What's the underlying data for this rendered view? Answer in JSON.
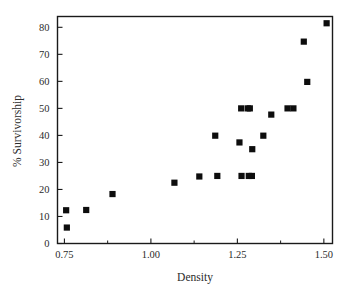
{
  "chart_data": {
    "type": "scatter",
    "title": "",
    "xlabel": "Density",
    "ylabel": "% Survivorship",
    "xlim": [
      0.73,
      1.525
    ],
    "ylim": [
      0,
      84
    ],
    "grid": false,
    "legend": "none",
    "x_ticks": [
      "0.75",
      "1.00",
      "1.25",
      "1.50"
    ],
    "x_tick_values": [
      0.75,
      1.0,
      1.25,
      1.5
    ],
    "x_minor_tick_values": [
      0.875,
      1.125,
      1.375
    ],
    "y_ticks": [
      "0",
      "10",
      "20",
      "30",
      "40",
      "50",
      "60",
      "70",
      "80"
    ],
    "y_tick_values": [
      0,
      10,
      20,
      30,
      40,
      50,
      60,
      70,
      80
    ],
    "marker": "filled-square",
    "marker_color": "#0d0d0d",
    "points": [
      {
        "x": 0.755,
        "y": 12.3
      },
      {
        "x": 0.757,
        "y": 5.9
      },
      {
        "x": 0.813,
        "y": 12.4
      },
      {
        "x": 0.889,
        "y": 18.3
      },
      {
        "x": 1.068,
        "y": 22.5
      },
      {
        "x": 1.14,
        "y": 24.8
      },
      {
        "x": 1.186,
        "y": 39.9
      },
      {
        "x": 1.192,
        "y": 25.0
      },
      {
        "x": 1.256,
        "y": 37.4
      },
      {
        "x": 1.261,
        "y": 50.0
      },
      {
        "x": 1.262,
        "y": 25.0
      },
      {
        "x": 1.28,
        "y": 50.0
      },
      {
        "x": 1.283,
        "y": 25.0
      },
      {
        "x": 1.286,
        "y": 50.0
      },
      {
        "x": 1.292,
        "y": 25.0
      },
      {
        "x": 1.293,
        "y": 34.9
      },
      {
        "x": 1.325,
        "y": 39.9
      },
      {
        "x": 1.348,
        "y": 47.7
      },
      {
        "x": 1.395,
        "y": 50.0
      },
      {
        "x": 1.412,
        "y": 50.0
      },
      {
        "x": 1.452,
        "y": 59.8
      },
      {
        "x": 1.442,
        "y": 74.7
      },
      {
        "x": 1.508,
        "y": 81.5
      }
    ]
  },
  "figure": {
    "background": "#ffffff",
    "axis_color": "#1a1a1a",
    "text_color": "#2b2b2b"
  }
}
